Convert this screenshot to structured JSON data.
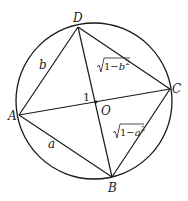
{
  "diagram": {
    "type": "inscribed-quadrilateral",
    "circle": {
      "cx": 94,
      "cy": 101,
      "r": 78
    },
    "points": {
      "A": {
        "label": "A",
        "x": 19,
        "y": 115
      },
      "B": {
        "label": "B",
        "x": 112,
        "y": 177
      },
      "C": {
        "label": "C",
        "x": 170,
        "y": 89
      },
      "D": {
        "label": "D",
        "x": 78,
        "y": 27
      },
      "O": {
        "label": "O",
        "x": 96,
        "y": 102
      }
    },
    "segments": [
      [
        "A",
        "B"
      ],
      [
        "B",
        "C"
      ],
      [
        "C",
        "D"
      ],
      [
        "D",
        "A"
      ],
      [
        "A",
        "C"
      ],
      [
        "B",
        "D"
      ]
    ],
    "edge_labels": {
      "AD": "b",
      "AB": "a",
      "OA": "1",
      "DC_prefix": "1−",
      "DC_var": "b",
      "DC_exp": "2",
      "BC_prefix": "1−",
      "BC_var": "a",
      "BC_exp": "2"
    }
  }
}
